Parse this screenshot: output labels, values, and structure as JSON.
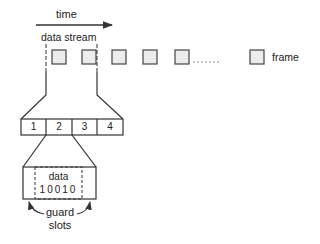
{
  "diagram": {
    "time_label": "time",
    "data_stream_label": "data stream",
    "legend": {
      "label": "frame",
      "icon": "square-frame-icon"
    },
    "slots": [
      "1",
      "2",
      "3",
      "4"
    ],
    "data_label": "data",
    "data_bits": "10010",
    "guard_label_line1": "guard",
    "guard_label_line2": "slots",
    "colors": {
      "stroke": "#333333",
      "frame_fill": "#ececec",
      "background": "#ffffff"
    }
  }
}
